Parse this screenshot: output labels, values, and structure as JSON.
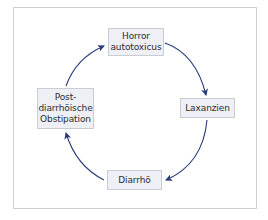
{
  "diagram": {
    "type": "cycle",
    "colors": {
      "arrow": "#2a3a7a",
      "node_fill": "#eef0f6",
      "node_border": "#c9ccd6",
      "frame_border": "#cfcfd2",
      "text": "#2b2b33"
    },
    "nodes": [
      {
        "id": "horror",
        "label": "Horror\nautotoxicus"
      },
      {
        "id": "laxanzien",
        "label": "Laxanzien"
      },
      {
        "id": "diarrhoe",
        "label": "Diarrhö"
      },
      {
        "id": "post",
        "label": "Post-\ndiarrhöische\nObstipation"
      }
    ],
    "edges": [
      {
        "from": "horror",
        "to": "laxanzien"
      },
      {
        "from": "laxanzien",
        "to": "diarrhoe"
      },
      {
        "from": "diarrhoe",
        "to": "post"
      },
      {
        "from": "post",
        "to": "horror"
      }
    ]
  }
}
